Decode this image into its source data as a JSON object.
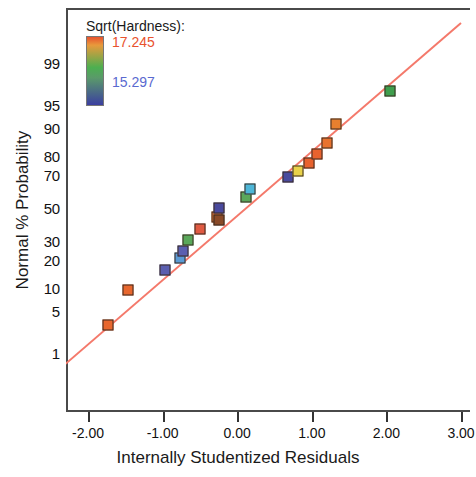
{
  "chart_data": {
    "type": "scatter",
    "title": "",
    "xlabel": "Internally Studentized Residuals",
    "ylabel": "Normal % Probability",
    "xlim": [
      -2.3,
      3.0
    ],
    "ylim_percent": [
      0.6,
      99.5
    ],
    "grid": false,
    "xticks": [
      "-2.00",
      "-1.00",
      "0.00",
      "1.00",
      "2.00",
      "3.00"
    ],
    "xtick_values": [
      -2,
      -1,
      0,
      1,
      2,
      3
    ],
    "yticks": [
      "99",
      "95",
      "90",
      "80",
      "70",
      "50",
      "30",
      "20",
      "10",
      "5",
      "1"
    ],
    "ytick_values": [
      99,
      95,
      90,
      80,
      70,
      50,
      30,
      20,
      10,
      5,
      1
    ],
    "reference_line": {
      "color": "#f4796b",
      "from_x": -2.3,
      "to_x": 3.0
    },
    "legend": {
      "position": "top-left-inside",
      "title": "Sqrt(Hardness):",
      "high_label": "17.245",
      "low_label": "15.297",
      "high_color": "#e8522e",
      "low_color": "#3b3fa0",
      "mid_color": "#4caf50"
    },
    "points": [
      {
        "x": -1.73,
        "p": 3.0,
        "color": "#e8672e"
      },
      {
        "x": -1.47,
        "p": 9.5,
        "color": "#e8672e"
      },
      {
        "x": -0.97,
        "p": 16.0,
        "color": "#5b5fb0"
      },
      {
        "x": -0.77,
        "p": 21.0,
        "color": "#5b9bd5"
      },
      {
        "x": -0.72,
        "p": 24.5,
        "color": "#5b5fb0"
      },
      {
        "x": -0.66,
        "p": 30.5,
        "color": "#5aa85a"
      },
      {
        "x": -0.5,
        "p": 37.0,
        "color": "#e05a42"
      },
      {
        "x": -0.27,
        "p": 44.0,
        "color": "#e8742e"
      },
      {
        "x": -0.24,
        "p": 42.5,
        "color": "#8a4a28"
      },
      {
        "x": -0.24,
        "p": 50.0,
        "color": "#4a4a9e"
      },
      {
        "x": 0.12,
        "p": 57.0,
        "color": "#5aa85a"
      },
      {
        "x": 0.17,
        "p": 62.0,
        "color": "#4db6d8"
      },
      {
        "x": 0.68,
        "p": 69.0,
        "color": "#4a4a9e"
      },
      {
        "x": 0.82,
        "p": 72.5,
        "color": "#e8d24a"
      },
      {
        "x": 0.96,
        "p": 76.5,
        "color": "#e8622e"
      },
      {
        "x": 1.07,
        "p": 80.5,
        "color": "#e8622e"
      },
      {
        "x": 1.2,
        "p": 85.0,
        "color": "#e8722e"
      },
      {
        "x": 1.33,
        "p": 91.0,
        "color": "#e8802e"
      },
      {
        "x": 2.05,
        "p": 97.0,
        "color": "#3f9e4d"
      }
    ]
  }
}
